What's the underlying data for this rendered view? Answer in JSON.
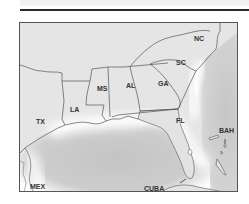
{
  "map": {
    "title": "",
    "colors": {
      "land": "#e3e3e3",
      "water": "#c9c9c9",
      "coast_glow": "#ffffff",
      "border": "#555555",
      "label": "#333333"
    },
    "labels": {
      "nc": "NC",
      "sc": "SC",
      "ga": "GA",
      "al": "AL",
      "ms": "MS",
      "la": "LA",
      "tx": "TX",
      "fl": "FL",
      "bah": "BAH",
      "mex": "MEX",
      "cuba": "CUBA"
    }
  }
}
